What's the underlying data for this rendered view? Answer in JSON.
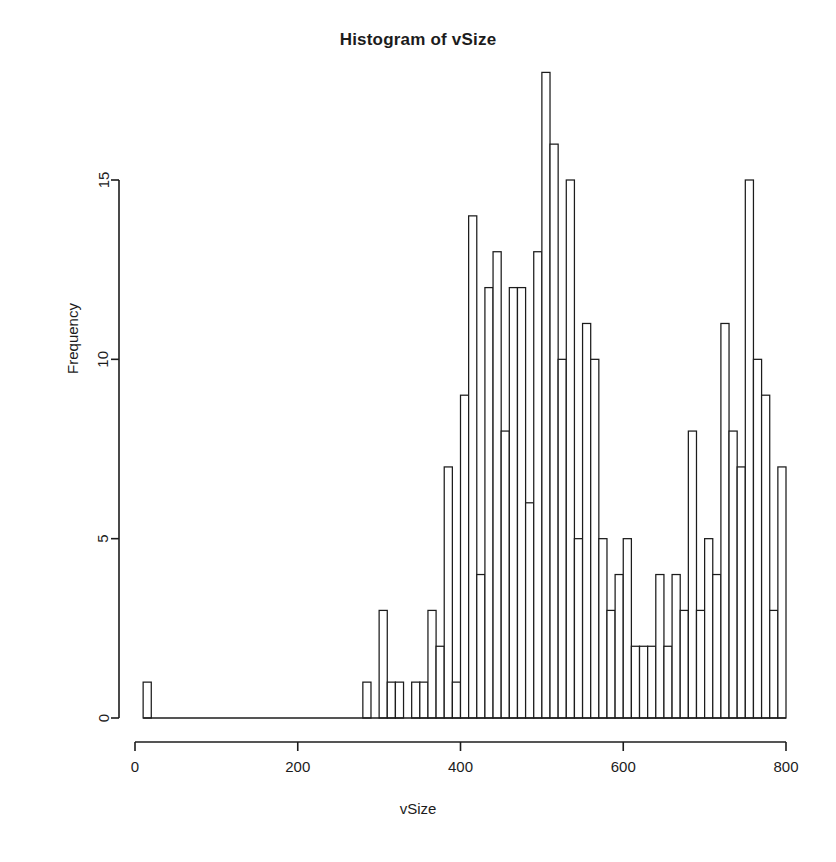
{
  "chart_data": {
    "type": "bar",
    "title": "Histogram of vSize",
    "xlabel": "vSize",
    "ylabel": "Frequency",
    "xlim": [
      0,
      800
    ],
    "ylim": [
      0,
      18
    ],
    "grid": false,
    "legend": false,
    "bin_width": 10,
    "x_ticks": [
      0,
      200,
      400,
      600,
      800
    ],
    "x_tick_labels": [
      "0",
      "200",
      "400",
      "600",
      "800"
    ],
    "y_ticks": [
      0,
      5,
      10,
      15
    ],
    "y_tick_labels": [
      "0",
      "5",
      "10",
      "15"
    ],
    "bins": [
      {
        "start": 10,
        "end": 20,
        "count": 1
      },
      {
        "start": 280,
        "end": 290,
        "count": 1
      },
      {
        "start": 290,
        "end": 300,
        "count": 0
      },
      {
        "start": 300,
        "end": 310,
        "count": 3
      },
      {
        "start": 310,
        "end": 320,
        "count": 1
      },
      {
        "start": 320,
        "end": 330,
        "count": 1
      },
      {
        "start": 330,
        "end": 340,
        "count": 0
      },
      {
        "start": 340,
        "end": 350,
        "count": 1
      },
      {
        "start": 350,
        "end": 360,
        "count": 1
      },
      {
        "start": 360,
        "end": 370,
        "count": 3
      },
      {
        "start": 370,
        "end": 380,
        "count": 2
      },
      {
        "start": 380,
        "end": 390,
        "count": 7
      },
      {
        "start": 390,
        "end": 400,
        "count": 1
      },
      {
        "start": 400,
        "end": 410,
        "count": 9
      },
      {
        "start": 410,
        "end": 420,
        "count": 14
      },
      {
        "start": 420,
        "end": 430,
        "count": 4
      },
      {
        "start": 430,
        "end": 440,
        "count": 12
      },
      {
        "start": 440,
        "end": 450,
        "count": 13
      },
      {
        "start": 450,
        "end": 460,
        "count": 8
      },
      {
        "start": 460,
        "end": 470,
        "count": 12
      },
      {
        "start": 470,
        "end": 480,
        "count": 12
      },
      {
        "start": 480,
        "end": 490,
        "count": 6
      },
      {
        "start": 490,
        "end": 500,
        "count": 13
      },
      {
        "start": 500,
        "end": 510,
        "count": 18
      },
      {
        "start": 510,
        "end": 520,
        "count": 16
      },
      {
        "start": 520,
        "end": 530,
        "count": 10
      },
      {
        "start": 530,
        "end": 540,
        "count": 15
      },
      {
        "start": 540,
        "end": 550,
        "count": 5
      },
      {
        "start": 550,
        "end": 560,
        "count": 11
      },
      {
        "start": 560,
        "end": 570,
        "count": 10
      },
      {
        "start": 570,
        "end": 580,
        "count": 5
      },
      {
        "start": 580,
        "end": 590,
        "count": 3
      },
      {
        "start": 590,
        "end": 600,
        "count": 4
      },
      {
        "start": 600,
        "end": 610,
        "count": 5
      },
      {
        "start": 610,
        "end": 620,
        "count": 2
      },
      {
        "start": 620,
        "end": 630,
        "count": 2
      },
      {
        "start": 630,
        "end": 640,
        "count": 2
      },
      {
        "start": 640,
        "end": 650,
        "count": 4
      },
      {
        "start": 650,
        "end": 660,
        "count": 2
      },
      {
        "start": 660,
        "end": 670,
        "count": 4
      },
      {
        "start": 670,
        "end": 680,
        "count": 3
      },
      {
        "start": 680,
        "end": 690,
        "count": 8
      },
      {
        "start": 690,
        "end": 700,
        "count": 3
      },
      {
        "start": 700,
        "end": 710,
        "count": 5
      },
      {
        "start": 710,
        "end": 720,
        "count": 4
      },
      {
        "start": 720,
        "end": 730,
        "count": 11
      },
      {
        "start": 730,
        "end": 740,
        "count": 8
      },
      {
        "start": 740,
        "end": 750,
        "count": 7
      },
      {
        "start": 750,
        "end": 760,
        "count": 15
      },
      {
        "start": 760,
        "end": 770,
        "count": 10
      },
      {
        "start": 770,
        "end": 780,
        "count": 9
      },
      {
        "start": 780,
        "end": 790,
        "count": 3
      },
      {
        "start": 790,
        "end": 800,
        "count": 7
      }
    ]
  },
  "style": {
    "axis_color": "#1c1c1c",
    "bar_fill": "#ffffff",
    "bar_stroke": "#1c1c1c",
    "background": "#ffffff"
  }
}
